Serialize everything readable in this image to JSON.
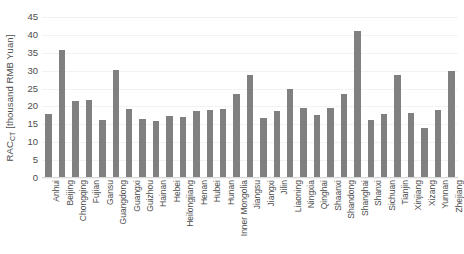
{
  "chart_data": {
    "type": "bar",
    "title": "",
    "xlabel": "",
    "ylabel": "RAC_CT [thousand RMB Yuan]",
    "ylabel_main": "RAC",
    "ylabel_sub": "CT",
    "ylabel_unit": " [thousand RMB Yuan]",
    "ylim": [
      0,
      45
    ],
    "yticks": [
      0,
      5,
      10,
      15,
      20,
      25,
      30,
      35,
      40,
      45
    ],
    "grid": true,
    "legend": "none",
    "bar_color": "#808080",
    "gridline_color": "#f2f2f2",
    "axis_color": "#d9d9d9",
    "text_color": "#4d4d4d",
    "background": "#ffffff",
    "categories": [
      "Anhui",
      "Beijing",
      "Chongqing",
      "Fujian",
      "Gansu",
      "Guangdong",
      "Guangxi",
      "Guizhou",
      "Hainan",
      "Hebei",
      "Heilongjiang",
      "Henan",
      "Hubei",
      "Hunan",
      "Inner Mongolia",
      "Jiangsu",
      "Jiangxi",
      "Jilin",
      "Liaoning",
      "Ningxia",
      "Qinghai",
      "Shaanxi",
      "Shandong",
      "Shanghai",
      "Shanxi",
      "Sichuan",
      "Tianjin",
      "Xinjiang",
      "Xizang",
      "Yunnan",
      "Zhejiang"
    ],
    "values": [
      17.8,
      35.7,
      21.5,
      21.7,
      16.2,
      30.2,
      19.2,
      16.5,
      15.8,
      17.2,
      17.0,
      18.8,
      19.0,
      19.3,
      23.6,
      28.7,
      16.7,
      18.7,
      25.0,
      19.6,
      17.6,
      19.5,
      23.4,
      41.2,
      16.1,
      17.9,
      28.7,
      18.1,
      14.0,
      19.0,
      29.8
    ]
  }
}
